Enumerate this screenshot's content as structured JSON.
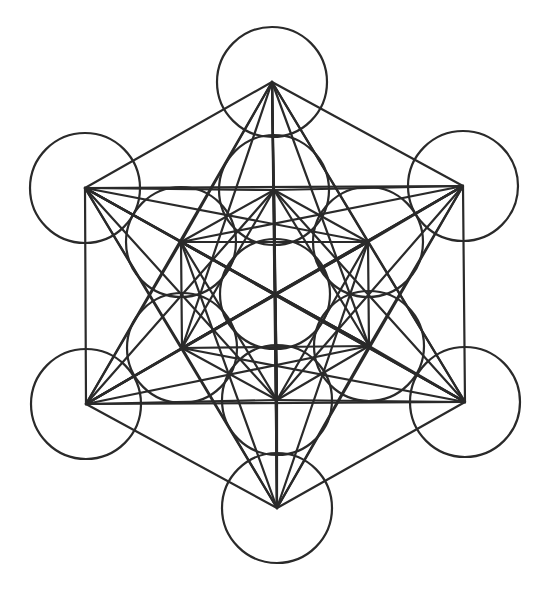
{
  "diagram": {
    "stroke_color": "#2a2a2a",
    "background": "#ffffff",
    "circle_radius": 55,
    "nodes": [
      {
        "id": "center",
        "x": 275,
        "y": 294
      },
      {
        "id": "inner-top",
        "x": 274,
        "y": 190
      },
      {
        "id": "inner-upper-right",
        "x": 368,
        "y": 242
      },
      {
        "id": "inner-lower-right",
        "x": 369,
        "y": 346
      },
      {
        "id": "inner-bottom",
        "x": 277,
        "y": 400
      },
      {
        "id": "inner-lower-left",
        "x": 182,
        "y": 348
      },
      {
        "id": "inner-upper-left",
        "x": 181,
        "y": 242
      },
      {
        "id": "outer-top",
        "x": 272,
        "y": 82
      },
      {
        "id": "outer-upper-right",
        "x": 463,
        "y": 186
      },
      {
        "id": "outer-lower-right",
        "x": 465,
        "y": 402
      },
      {
        "id": "outer-bottom",
        "x": 277,
        "y": 508
      },
      {
        "id": "outer-lower-left",
        "x": 86,
        "y": 404
      },
      {
        "id": "outer-upper-left",
        "x": 85,
        "y": 188
      }
    ],
    "connect_all_nodes": true
  }
}
